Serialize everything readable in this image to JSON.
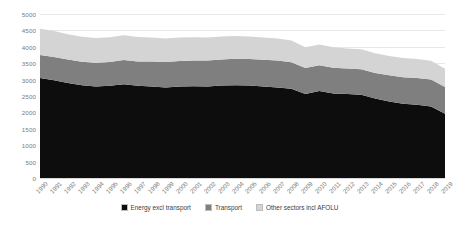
{
  "chart_data": {
    "type": "area",
    "title": "",
    "xlabel": "",
    "ylabel": "",
    "ylim": [
      0,
      5000
    ],
    "ytick_values": [
      0,
      500,
      1000,
      1500,
      2000,
      2500,
      3000,
      3500,
      4000,
      4500,
      5000
    ],
    "ytick_labels": [
      "0",
      "500",
      "1000",
      "1500",
      "2000",
      "2500",
      "3000",
      "3500",
      "4000",
      "4500",
      "5000"
    ],
    "grid": true,
    "legend_position": "bottom",
    "stacked": true,
    "categories": [
      "1990",
      "1991",
      "1992",
      "1993",
      "1994",
      "1995",
      "1996",
      "1997",
      "1998",
      "1999",
      "2000",
      "2001",
      "2002",
      "2003",
      "2004",
      "2005",
      "2006",
      "2007",
      "2008",
      "2009",
      "2010",
      "2011",
      "2012",
      "2013",
      "2014",
      "2015",
      "2016",
      "2017",
      "2018",
      "2019"
    ],
    "series": [
      {
        "name": "Energy excl transport",
        "color": "#0d0d0d",
        "values": [
          3050,
          2980,
          2900,
          2830,
          2790,
          2810,
          2860,
          2810,
          2790,
          2760,
          2790,
          2800,
          2790,
          2820,
          2830,
          2820,
          2790,
          2760,
          2720,
          2560,
          2650,
          2580,
          2560,
          2540,
          2420,
          2330,
          2260,
          2230,
          2180,
          1960
        ]
      },
      {
        "name": "Transport",
        "color": "#7f7f7f",
        "values": [
          700,
          710,
          715,
          715,
          720,
          730,
          740,
          745,
          760,
          775,
          780,
          785,
          790,
          795,
          805,
          810,
          815,
          820,
          810,
          790,
          790,
          785,
          775,
          775,
          785,
          800,
          810,
          820,
          820,
          815
        ]
      },
      {
        "name": "Other sectors incl AFOLU",
        "color": "#d4d4d4",
        "values": [
          800,
          790,
          770,
          760,
          755,
          750,
          750,
          740,
          730,
          720,
          710,
          705,
          700,
          700,
          695,
          685,
          680,
          675,
          665,
          640,
          630,
          620,
          615,
          610,
          600,
          590,
          585,
          580,
          575,
          555
        ]
      }
    ],
    "totals": [
      4550,
      4480,
      4385,
      4305,
      4265,
      4290,
      4350,
      4295,
      4280,
      4255,
      4280,
      4290,
      4280,
      4315,
      4330,
      4315,
      4285,
      4255,
      4195,
      3990,
      4070,
      3985,
      3950,
      3925,
      3805,
      3720,
      3655,
      3630,
      3575,
      3330
    ]
  },
  "legend": {
    "items": [
      {
        "label": "Energy excl transport"
      },
      {
        "label": "Transport"
      },
      {
        "label": "Other sectors incl AFOLU"
      }
    ]
  }
}
